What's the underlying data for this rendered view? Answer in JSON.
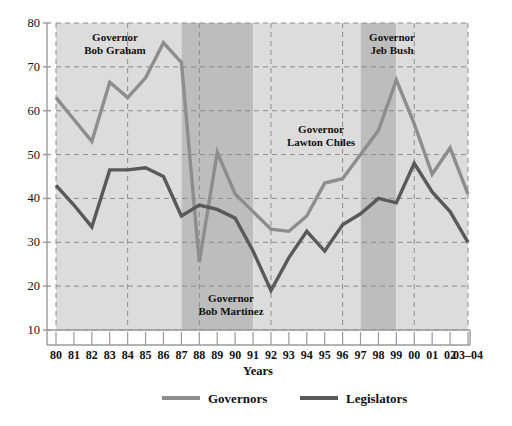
{
  "chart_data": {
    "type": "line",
    "title": "",
    "xlabel": "Years",
    "ylabel": "",
    "xlim": [
      1980,
      2004
    ],
    "ylim": [
      10,
      80
    ],
    "ytick_step": 10,
    "grid": true,
    "grid_style": "dashed",
    "legend_position": "bottom",
    "x": [
      "80",
      "81",
      "82",
      "83",
      "84",
      "85",
      "86",
      "87",
      "88",
      "89",
      "90",
      "91",
      "92",
      "93",
      "94",
      "95",
      "96",
      "97",
      "98",
      "99",
      "00",
      "01",
      "02",
      "03–04"
    ],
    "series": [
      {
        "name": "Governors",
        "color": "#8d8d8d",
        "values": [
          63,
          58,
          53,
          66.5,
          63,
          67.5,
          75.5,
          71,
          25.5,
          50.5,
          41,
          37,
          33,
          32.5,
          36,
          43.5,
          44.5,
          50,
          55.5,
          67,
          57,
          45.5,
          51.5,
          41
        ]
      },
      {
        "name": "Legislators",
        "color": "#595959",
        "values": [
          43,
          38.5,
          33.5,
          46.5,
          46.5,
          47,
          45,
          36,
          38.5,
          37.5,
          35.5,
          28,
          19,
          26.5,
          32.5,
          28,
          34,
          36.5,
          40,
          39,
          48,
          41.5,
          37,
          30
        ]
      }
    ],
    "bands": [
      {
        "label_line1": "Governor",
        "label_line2": "Bob Graham",
        "start": "80",
        "end": "87",
        "shade": "light",
        "color": "#dcdcdc",
        "label_pos": "top"
      },
      {
        "label_line1": "Governor",
        "label_line2": "Bob Martinez",
        "start": "87",
        "end": "91",
        "shade": "dark",
        "color": "#bdbdbd",
        "label_pos": "bottom"
      },
      {
        "label_line1": "Governor",
        "label_line2": "Lawton Chiles",
        "start": "91",
        "end": "97",
        "shade": "light",
        "color": "#dcdcdc",
        "label_pos": "middle"
      },
      {
        "label_line1": "Governor",
        "label_line2": "Jeb Bush",
        "start": "97",
        "end": "99",
        "shade": "dark",
        "color": "#bdbdbd",
        "label_pos": "top"
      },
      {
        "label_line1": "",
        "label_line2": "",
        "start": "99",
        "end": "03–04",
        "shade": "light",
        "color": "#dcdcdc",
        "label_pos": "none"
      }
    ],
    "ytick_labels": [
      "10",
      "20",
      "30",
      "40",
      "50",
      "60",
      "70",
      "80"
    ],
    "legend": [
      {
        "label": "Governors",
        "color": "#8d8d8d"
      },
      {
        "label": "Legislators",
        "color": "#595959"
      }
    ]
  },
  "axis": {
    "x_title": "Years",
    "y_ticks": [
      "80",
      "70",
      "60",
      "50",
      "40",
      "30",
      "20",
      "10"
    ]
  },
  "bands_text": {
    "graham_1": "Governor",
    "graham_2": "Bob Graham",
    "martinez_1": "Governor",
    "martinez_2": "Bob Martinez",
    "chiles_1": "Governor",
    "chiles_2": "Lawton Chiles",
    "bush_1": "Governor",
    "bush_2": "Jeb Bush"
  },
  "legend_text": {
    "governors": "Governors",
    "legislators": "Legislators"
  },
  "xticks": {
    "t0": "80",
    "t1": "81",
    "t2": "82",
    "t3": "83",
    "t4": "84",
    "t5": "85",
    "t6": "86",
    "t7": "87",
    "t8": "88",
    "t9": "89",
    "t10": "90",
    "t11": "91",
    "t12": "92",
    "t13": "93",
    "t14": "94",
    "t15": "95",
    "t16": "96",
    "t17": "97",
    "t18": "98",
    "t19": "99",
    "t20": "00",
    "t21": "01",
    "t22": "02",
    "t23": "03–04"
  },
  "yticks": {
    "y80": "80",
    "y70": "70",
    "y60": "60",
    "y50": "50",
    "y40": "40",
    "y30": "30",
    "y20": "20",
    "y10": "10"
  },
  "colors": {
    "governors_line": "#8d8d8d",
    "legislators_line": "#595959",
    "band_light": "#dcdcdc",
    "band_dark": "#bdbdbd",
    "axis": "#9a9a9a",
    "grid": "#8c8c8c",
    "text": "#111111"
  }
}
